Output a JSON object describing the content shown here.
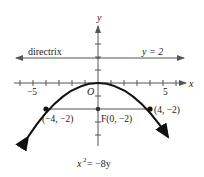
{
  "diagram": {
    "type": "parabola",
    "equation": "x² = −8y",
    "equation_parts": {
      "lhs_base": "x",
      "lhs_exp": "2",
      "rhs": " = −8y"
    },
    "axes": {
      "x_label": "x",
      "y_label": "y",
      "origin_label": "O",
      "x_tick_labels": [
        {
          "value": -5,
          "text": "−5"
        },
        {
          "value": 5,
          "text": "5"
        }
      ],
      "x_range": [
        -6,
        6
      ],
      "tick_spacing": 1
    },
    "directrix": {
      "label": "directrix",
      "equation_label": "y = 2",
      "y": 2
    },
    "focus": {
      "label": "F(0, −2)",
      "x": 0,
      "y": -2
    },
    "points": [
      {
        "label": "(−4, −2)",
        "x": -4,
        "y": -2
      },
      {
        "label": "(4, −2)",
        "x": 4,
        "y": -2
      }
    ],
    "latus_rectum": {
      "from": [
        -4,
        -2
      ],
      "to": [
        4,
        -2
      ]
    },
    "colors": {
      "curve": "#111111",
      "axis": "#555555",
      "text": "#1a1a1a"
    }
  }
}
